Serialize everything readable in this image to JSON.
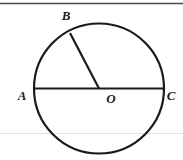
{
  "figure": {
    "type": "geometry-diagram",
    "canvas": {
      "width": 183,
      "height": 160,
      "background": "#ffffff"
    },
    "colors": {
      "stroke": "#1a1a1a",
      "label": "#1a1a1a",
      "top_rule": "#4a4a4a",
      "faint_rule": "#e2e2e2",
      "background": "#ffffff"
    },
    "rules": {
      "top_rule_y": 3.5,
      "faint_rule_y": 133.5
    },
    "circle": {
      "center_x": 99,
      "center_y": 88.5,
      "radius": 65,
      "stroke_width": 2.2
    },
    "segments": [
      {
        "name": "diameter-ac",
        "label": "AC",
        "x1": 34,
        "y1": 88.5,
        "x2": 164,
        "y2": 88.5,
        "stroke_width": 2.2
      },
      {
        "name": "radius-ob",
        "label": "OB",
        "x1": 99,
        "y1": 88.5,
        "x2": 70,
        "y2": 33,
        "stroke_width": 2.2
      }
    ],
    "labels": [
      {
        "name": "point-b",
        "text": "B",
        "x": 66,
        "y": 20
      },
      {
        "name": "point-a",
        "text": "A",
        "x": 22,
        "y": 100
      },
      {
        "name": "point-o",
        "text": "O",
        "x": 111,
        "y": 103
      },
      {
        "name": "point-c",
        "text": "C",
        "x": 171,
        "y": 100
      }
    ]
  }
}
